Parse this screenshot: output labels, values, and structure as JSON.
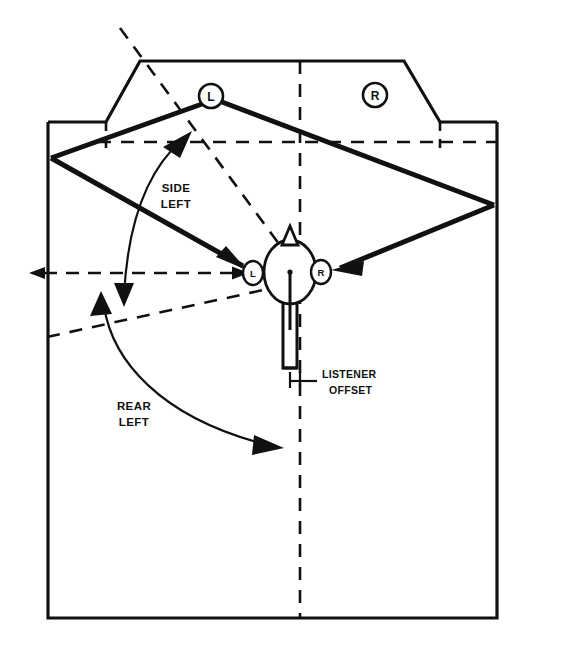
{
  "diagram": {
    "colors": {
      "ink": "#111111",
      "background": "#ffffff"
    },
    "room": {
      "name": "listening-room-outline",
      "left_wall_x": 48,
      "right_wall_x": 497,
      "bottom_y": 618,
      "front_wall_y": 61,
      "corner_cut": true
    },
    "speakers": [
      {
        "id": "front-left",
        "label": "L",
        "x": 211,
        "y": 96,
        "r": 12
      },
      {
        "id": "front-right",
        "label": "R",
        "x": 375,
        "y": 95,
        "r": 12
      }
    ],
    "listener": {
      "name": "listener-head",
      "head_center_x": 290,
      "head_center_y": 272,
      "head_rx": 26,
      "head_ry": 32,
      "ears": [
        {
          "id": "ear-left",
          "label": "L",
          "x": 253,
          "y": 273
        },
        {
          "id": "ear-right",
          "label": "R",
          "x": 321,
          "y": 272
        }
      ]
    },
    "labels": {
      "side_left": {
        "line1": "SIDE",
        "line2": "LEFT"
      },
      "rear_left": {
        "line1": "REAR",
        "line2": "LEFT"
      },
      "listener_offset": {
        "line1": "LISTENER",
        "line2": "OFFSET"
      }
    },
    "annotations": {
      "side_left_arc": "double-headed curved arrow spanning the side-left angular zone",
      "rear_left_arc": "double-headed curved arrow spanning the rear-left angular zone",
      "axis_reference": "dashed horizontal reference axis through listener ears",
      "centerline": "dashed vertical room centerline"
    }
  }
}
